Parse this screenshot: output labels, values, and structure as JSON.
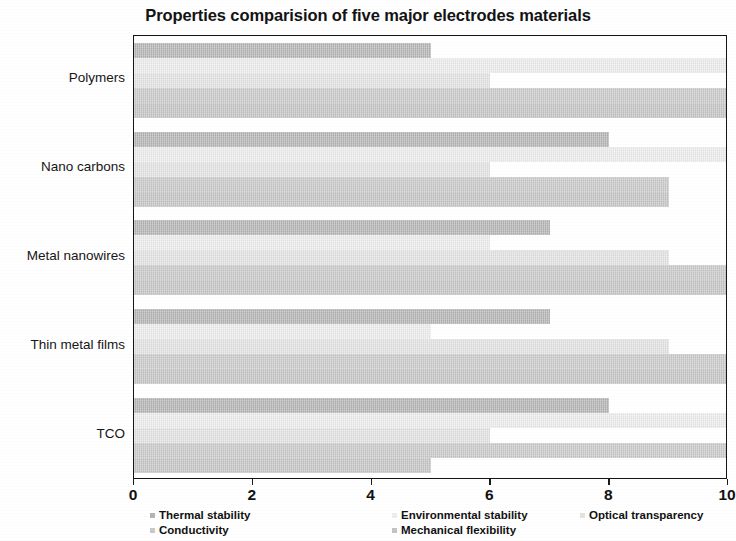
{
  "chart_data": {
    "type": "bar",
    "orientation": "horizontal",
    "title": "Properties comparision of five major electrodes materials",
    "xlabel": "",
    "ylabel": "",
    "xlim": [
      0,
      10
    ],
    "xticks": [
      "0",
      "2",
      "4",
      "6",
      "8",
      "10"
    ],
    "grid": false,
    "legend_position": "bottom",
    "categories": [
      "Polymers",
      "Nano carbons",
      "Metal nanowires",
      "Thin metal films",
      "TCO"
    ],
    "series": [
      {
        "name": "Thermal stability",
        "color": "#b4b4b4",
        "values": [
          5,
          8,
          7,
          7,
          8
        ]
      },
      {
        "name": "Environmental stability",
        "color": "#ededed",
        "values": [
          10,
          10,
          6,
          5,
          10
        ]
      },
      {
        "name": "Optical transparency",
        "color": "#e3e3e3",
        "values": [
          6,
          6,
          9,
          9,
          6
        ]
      },
      {
        "name": "Conductivity",
        "color": "#c9c9c9",
        "values": [
          10,
          9,
          10,
          10,
          10
        ]
      },
      {
        "name": "Mechanical flexibility",
        "color": "#c4c4c4",
        "values": [
          10,
          9,
          10,
          10,
          5
        ]
      }
    ]
  },
  "legend": {
    "items": [
      {
        "label": "Thermal stability"
      },
      {
        "label": "Environmental stability"
      },
      {
        "label": "Optical transparency"
      },
      {
        "label": "Conductivity"
      },
      {
        "label": "Mechanical flexibility"
      }
    ]
  }
}
